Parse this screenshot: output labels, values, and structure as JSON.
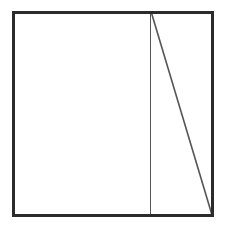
{
  "figure": {
    "canvas": {
      "width": 226,
      "height": 230,
      "background_color": "#ffffff"
    },
    "style": {
      "outer_stroke_color": "#2b2b2b",
      "outer_stroke_width": 3,
      "inner_stroke_color": "#555555",
      "inner_stroke_width": 1.6,
      "fill_color": "#ffffff"
    },
    "shapes": [
      {
        "name": "outer-square",
        "type": "rect",
        "x": 13.5,
        "y": 12.5,
        "width": 199,
        "height": 203
      },
      {
        "name": "vertical-divider",
        "type": "line",
        "x1": 150.5,
        "y1": 12.5,
        "x2": 150.5,
        "y2": 215.5
      },
      {
        "name": "diagonal-line",
        "type": "line",
        "x1": 151.5,
        "y1": 13.0,
        "x2": 212.0,
        "y2": 215.0
      }
    ],
    "regions": [
      {
        "name": "left-rectangle",
        "label": ""
      },
      {
        "name": "upper-right-triangle",
        "label": ""
      },
      {
        "name": "lower-left-triangle-of-strip",
        "label": ""
      }
    ]
  }
}
